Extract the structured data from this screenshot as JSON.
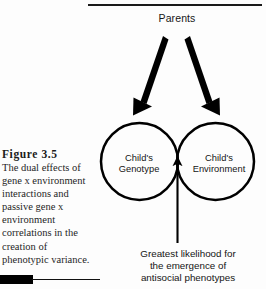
{
  "figure": {
    "caption_title": "Figure 3.5",
    "caption_lines": [
      "The dual effects of",
      "gene x environment",
      "interactions and",
      "passive gene x",
      "environment",
      "correlations in the",
      "creation of",
      "phenotypic variance."
    ]
  },
  "diagram": {
    "top_label": "Parents",
    "left_circle": {
      "line1": "Child's",
      "line2": "Genotype"
    },
    "right_circle": {
      "line1": "Child's",
      "line2": "Environment"
    },
    "bottom_note": [
      "Greatest likelihood for",
      "the emergence of",
      "antisocial phenotypes"
    ]
  },
  "colors": {
    "ink": "#000000",
    "text": "#141414",
    "rule": "#1a1a1a"
  }
}
